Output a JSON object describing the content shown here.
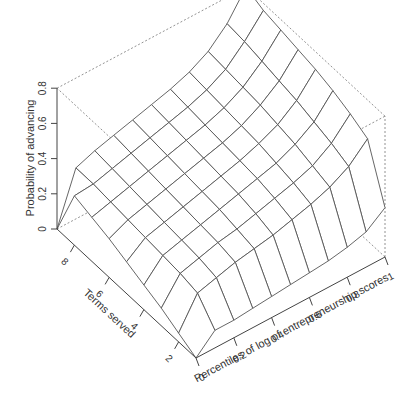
{
  "chart_data": {
    "type": "surface3d",
    "title": "",
    "xlabel": "Percentiles of log of entrepreneurship scores",
    "ylabel": "Terms served",
    "zlabel": "Probability of advancing",
    "x_ticks": [
      "0",
      "0.2",
      "0.4",
      "0.6",
      "0.8",
      "1"
    ],
    "y_ticks": [
      "2",
      "4",
      "6",
      "8"
    ],
    "z_ticks": [
      "0",
      "0.2",
      "0.4",
      "0.6",
      "0.8"
    ],
    "xlim": [
      0,
      1
    ],
    "ylim": [
      1,
      9
    ],
    "zlim": [
      0,
      0.8
    ],
    "x": [
      0,
      0.1,
      0.2,
      0.3,
      0.4,
      0.5,
      0.6,
      0.7,
      0.8,
      0.9,
      1.0
    ],
    "y": [
      1,
      2,
      3,
      4,
      5,
      6,
      7,
      8,
      9
    ],
    "z": [
      [
        0.0,
        0.1,
        0.1,
        0.11,
        0.12,
        0.13,
        0.14,
        0.15,
        0.17,
        0.2,
        0.28
      ],
      [
        0.05,
        0.22,
        0.25,
        0.28,
        0.3,
        0.32,
        0.35,
        0.38,
        0.42,
        0.48,
        0.58
      ],
      [
        0.1,
        0.24,
        0.27,
        0.3,
        0.32,
        0.35,
        0.38,
        0.41,
        0.45,
        0.52,
        0.63
      ],
      [
        0.14,
        0.25,
        0.28,
        0.31,
        0.34,
        0.37,
        0.4,
        0.43,
        0.48,
        0.55,
        0.67
      ],
      [
        0.18,
        0.26,
        0.29,
        0.32,
        0.35,
        0.38,
        0.41,
        0.45,
        0.5,
        0.58,
        0.7
      ],
      [
        0.22,
        0.27,
        0.3,
        0.33,
        0.36,
        0.39,
        0.42,
        0.46,
        0.52,
        0.6,
        0.72
      ],
      [
        0.25,
        0.28,
        0.31,
        0.34,
        0.37,
        0.4,
        0.43,
        0.47,
        0.53,
        0.62,
        0.74
      ],
      [
        0.28,
        0.29,
        0.32,
        0.35,
        0.38,
        0.41,
        0.44,
        0.48,
        0.54,
        0.64,
        0.76
      ],
      [
        0.0,
        0.29,
        0.33,
        0.36,
        0.39,
        0.42,
        0.45,
        0.49,
        0.55,
        0.65,
        0.8
      ]
    ],
    "grid": false,
    "box": true
  },
  "projection": {
    "origin": [
      196,
      358
    ],
    "x_vec": [
      189,
      -101
    ],
    "y_vec": [
      -139,
      -129
    ],
    "z_scale": 176
  },
  "colors": {
    "surface_line": "#555555",
    "box_line": "#777777",
    "text": "#333333"
  }
}
